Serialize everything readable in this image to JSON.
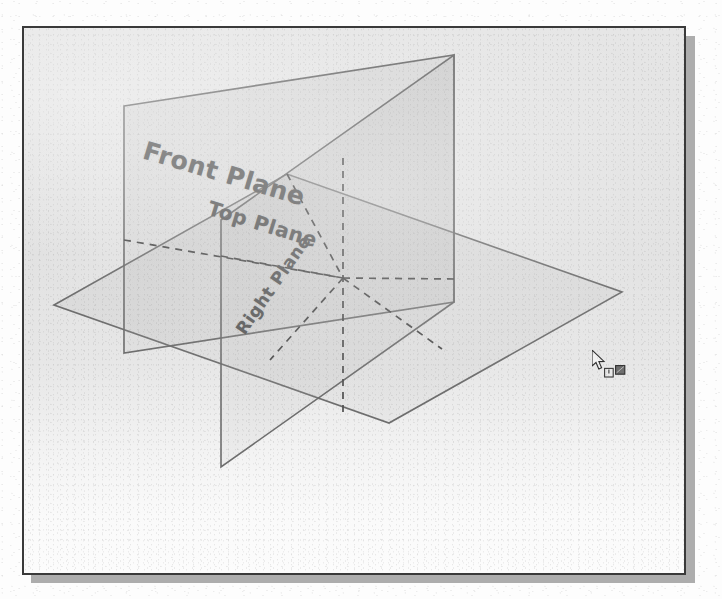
{
  "figure": {
    "caption": "",
    "background_color": "#e4e4e4",
    "page_color": "#fdfdfd",
    "frame_border_color": "#3a3a3a",
    "shadow_color": "#adadad",
    "line_color": "#6e6e6e",
    "hidden_line_color": "#5a5a5a",
    "label_color": "#5a5a5a",
    "fill_color": "rgba(160,160,160,0.16)"
  },
  "labels": {
    "front_plane": "Front Plane",
    "top_plane": "Top Plane",
    "right_plane": "Right Plane"
  },
  "planes": [
    {
      "name": "front-plane",
      "label": "Front Plane",
      "orientation": "front",
      "line_style": "solid",
      "points": "122,104 452,53 452,300 122,351"
    },
    {
      "name": "top-plane",
      "label": "Top Plane",
      "orientation": "top",
      "line_style": "solid",
      "points": "52,303 285,172 620,290 387,421"
    },
    {
      "name": "right-plane",
      "label": "Right Plane",
      "orientation": "right",
      "line_style": "solid",
      "points": "219,218 452,53 452,300 219,465"
    }
  ],
  "hidden_lines": [
    {
      "name": "top-plane-hidden-edge-left",
      "from": "122,238",
      "to": "341,238"
    },
    {
      "name": "top-plane-hidden-edge-right",
      "from": "341,238",
      "to": "452,277"
    },
    {
      "name": "front-plane-hidden-vertical",
      "from": "341,156",
      "to": "341,412"
    },
    {
      "name": "right-plane-hidden-diag-up",
      "from": "285,172",
      "to": "341,276"
    },
    {
      "name": "right-plane-hidden-diag-down",
      "from": "341,276",
      "to": "440,347"
    },
    {
      "name": "origin-diag-lower-left",
      "from": "341,276",
      "to": "268,358"
    },
    {
      "name": "origin-horizontal",
      "from": "219,254",
      "to": "341,276"
    }
  ],
  "origin": {
    "name": "origin-point",
    "x": 341,
    "y": 276
  },
  "cursor": {
    "name": "mouse-cursor",
    "icon": "arrow-pointer-icon",
    "x": 568,
    "y": 322,
    "badge_icon": "plane-select-badge-icon",
    "badge_x": 580,
    "badge_y": 337
  }
}
